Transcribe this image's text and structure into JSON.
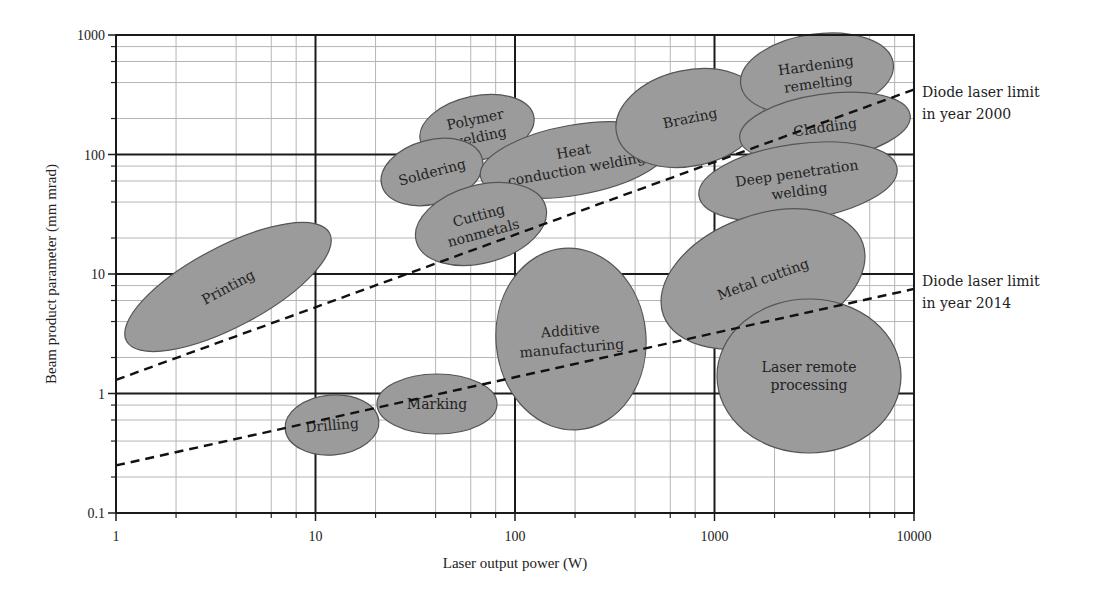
{
  "chart_data": {
    "type": "scatter",
    "subtype": "log-log region diagram (ellipses)",
    "title": "",
    "xlabel": "Laser output power (W)",
    "ylabel": "Beam product parameter (mm mrad)",
    "xscale": "log",
    "yscale": "log",
    "xlim": [
      1,
      10000
    ],
    "ylim": [
      0.1,
      1000
    ],
    "x_ticks": [
      "1",
      "10",
      "100",
      "1000",
      "10000"
    ],
    "y_ticks": [
      "0.1",
      "1",
      "10",
      "100",
      "1000"
    ],
    "grid": true,
    "minor_grid": [
      2,
      4,
      6,
      8
    ],
    "region_fill": "#9b9b9b",
    "regions": [
      {
        "name": "Printing",
        "lines": [
          "Printing"
        ],
        "x_center": 3.7,
        "y_center": 5.5,
        "cx": 228,
        "cy": 287,
        "rx": 115,
        "ry": 40,
        "rot": -28
      },
      {
        "name": "Drilling",
        "lines": [
          "Drilling"
        ],
        "x_center": 14,
        "y_center": 0.55,
        "cx": 332,
        "cy": 425,
        "rx": 47,
        "ry": 30,
        "rot": -5
      },
      {
        "name": "Marking",
        "lines": [
          "Marking"
        ],
        "x_center": 47,
        "y_center": 0.82,
        "cx": 437,
        "cy": 404,
        "rx": 60,
        "ry": 30,
        "rot": 0
      },
      {
        "name": "Polymer welding",
        "lines": [
          "Polymer",
          "welding"
        ],
        "x_center": 60,
        "y_center": 140,
        "cx": 477,
        "cy": 128,
        "rx": 58,
        "ry": 32,
        "rot": -12
      },
      {
        "name": "Soldering",
        "lines": [
          "Soldering"
        ],
        "x_center": 35,
        "y_center": 60,
        "cx": 432,
        "cy": 172,
        "rx": 52,
        "ry": 32,
        "rot": -15
      },
      {
        "name": "Heat conduction welding",
        "lines": [
          "Heat",
          "conduction welding"
        ],
        "x_center": 180,
        "y_center": 75,
        "cx": 575,
        "cy": 160,
        "rx": 96,
        "ry": 35,
        "rot": -10
      },
      {
        "name": "Cutting nonmetals",
        "lines": [
          "Cutting",
          "nonmetals"
        ],
        "x_center": 65,
        "y_center": 22,
        "cx": 481,
        "cy": 224,
        "rx": 67,
        "ry": 39,
        "rot": -15
      },
      {
        "name": "Additive manufacturing",
        "lines": [
          "Additive",
          "manufacturing"
        ],
        "x_center": 190,
        "y_center": 2.8,
        "cx": 571,
        "cy": 339,
        "rx": 75,
        "ry": 91,
        "rot": -5
      },
      {
        "name": "Brazing",
        "lines": [
          "Brazing"
        ],
        "x_center": 650,
        "y_center": 120,
        "cx": 690,
        "cy": 118,
        "rx": 75,
        "ry": 48,
        "rot": -12
      },
      {
        "name": "Hardening remelting",
        "lines": [
          "Hardening",
          "remelting"
        ],
        "x_center": 2800,
        "y_center": 280,
        "cx": 817,
        "cy": 74,
        "rx": 77,
        "ry": 40,
        "rot": -8
      },
      {
        "name": "Cladding",
        "lines": [
          "Cladding"
        ],
        "x_center": 3100,
        "y_center": 100,
        "cx": 825,
        "cy": 127,
        "rx": 86,
        "ry": 33,
        "rot": -8
      },
      {
        "name": "Deep penetration welding",
        "lines": [
          "Deep penetration",
          "welding"
        ],
        "x_center": 2300,
        "y_center": 35,
        "cx": 798,
        "cy": 182,
        "rx": 100,
        "ry": 38,
        "rot": -8
      },
      {
        "name": "Metal cutting",
        "lines": [
          "Metal cutting"
        ],
        "x_center": 1500,
        "y_center": 5.5,
        "cx": 763,
        "cy": 279,
        "rx": 106,
        "ry": 64,
        "rot": -20
      },
      {
        "name": "Laser remote processing",
        "lines": [
          "Laser remote",
          "processing"
        ],
        "x_center": 2900,
        "y_center": 1.4,
        "cx": 809,
        "cy": 376,
        "rx": 92,
        "ry": 77,
        "rot": 0
      }
    ],
    "series": [
      {
        "name": "Diode laser limit in year 2000",
        "style": "dashed",
        "x": [
          1,
          10000
        ],
        "y": [
          1.3,
          350
        ]
      },
      {
        "name": "Diode laser limit in year 2014",
        "style": "dashed",
        "x": [
          1,
          10000
        ],
        "y": [
          0.25,
          7.5
        ]
      }
    ],
    "annotations": [
      {
        "lines": [
          "Diode laser limit",
          "in year 2000"
        ],
        "x_px": 922,
        "y_px": 97
      },
      {
        "lines": [
          "Diode laser limit",
          "in year 2014"
        ],
        "x_px": 922,
        "y_px": 286
      }
    ]
  }
}
